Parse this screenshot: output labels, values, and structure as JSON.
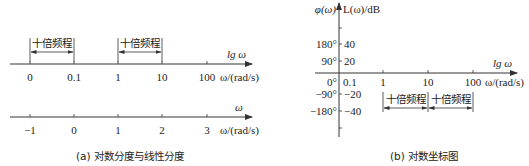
{
  "panel_a": {
    "log_axis": {
      "name_label": "lg ω",
      "unit_label": "ω/(rad/s)",
      "ticks": [
        "0",
        "0.1",
        "1",
        "10",
        "100"
      ]
    },
    "decade_brackets": [
      {
        "label": "十倍频程",
        "from": "0",
        "to": "0.1"
      },
      {
        "label": "十倍频程",
        "from": "1",
        "to": "10"
      }
    ],
    "linear_axis": {
      "name_label": "ω",
      "unit_label": "ω/(rad/s)",
      "ticks": [
        "−1",
        "0",
        "1",
        "2",
        "3"
      ]
    },
    "caption": "(a) 对数分度与线性分度"
  },
  "panel_b": {
    "y_left_label": "φ(ω)",
    "y_right_label": "L(ω)/dB",
    "phase_ticks": [
      "180°",
      "90°",
      "0°",
      "−90°",
      "−180°"
    ],
    "magnitude_ticks": [
      "40",
      "20",
      "",
      "−20",
      "−40"
    ],
    "x_axis": {
      "name_label": "lg ω",
      "unit_label": "ω/(rad/s)",
      "ticks": [
        "0.1",
        "1",
        "10",
        "100"
      ]
    },
    "decade_brackets": [
      {
        "label": "十倍频程",
        "from": "1",
        "to": "10"
      },
      {
        "label": "十倍频程",
        "from": "10",
        "to": "100"
      }
    ],
    "caption": "(b) 对数坐标图"
  }
}
